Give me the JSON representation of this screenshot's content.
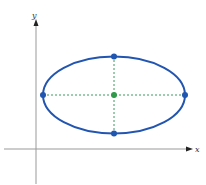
{
  "diagram": {
    "type": "ellipse-on-axes",
    "axes": {
      "x_label": "x",
      "y_label": "y",
      "color": "#888888",
      "arrow_color": "#222222"
    },
    "ellipse": {
      "center": [
        114,
        95
      ],
      "rx": 71,
      "ry": 39,
      "stroke_color": "#2255b0",
      "stroke_width": 2
    },
    "axes_lines": {
      "major_axis_color": "#3a9a5a",
      "minor_axis_color": "#3a9a5a",
      "dash": "2,2"
    },
    "points": [
      {
        "name": "left-vertex",
        "x": 43,
        "y": 95,
        "color": "#1f56b0"
      },
      {
        "name": "right-vertex",
        "x": 185,
        "y": 95,
        "color": "#1f56b0"
      },
      {
        "name": "top-co-vertex",
        "x": 114,
        "y": 56,
        "color": "#1f56b0"
      },
      {
        "name": "bottom-co-vertex",
        "x": 114,
        "y": 133,
        "color": "#1f56b0"
      },
      {
        "name": "center",
        "x": 114,
        "y": 95,
        "color": "#2f9a4a"
      }
    ]
  }
}
